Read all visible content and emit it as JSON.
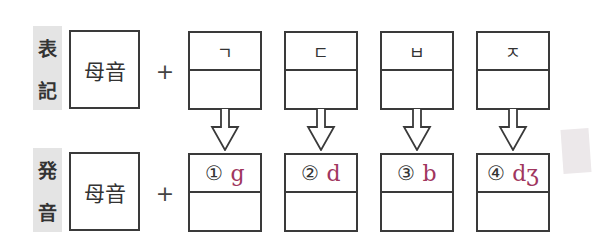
{
  "rows": {
    "notation": {
      "label": [
        "表",
        "記"
      ],
      "vowel": "母音",
      "plus": "+"
    },
    "pronunciation": {
      "label": [
        "発",
        "音"
      ],
      "vowel": "母音",
      "plus": "+"
    }
  },
  "consonants": [
    {
      "hangul": "ㄱ",
      "number": "①",
      "ipa": "g"
    },
    {
      "hangul": "ㄷ",
      "number": "②",
      "ipa": "d"
    },
    {
      "hangul": "ㅂ",
      "number": "③",
      "ipa": "b"
    },
    {
      "hangul": "ㅈ",
      "number": "④",
      "ipa": "dʒ"
    }
  ],
  "colors": {
    "ipa": "#a0365e",
    "label_bg": "#e4e4e4",
    "line": "#3a3a3a"
  }
}
